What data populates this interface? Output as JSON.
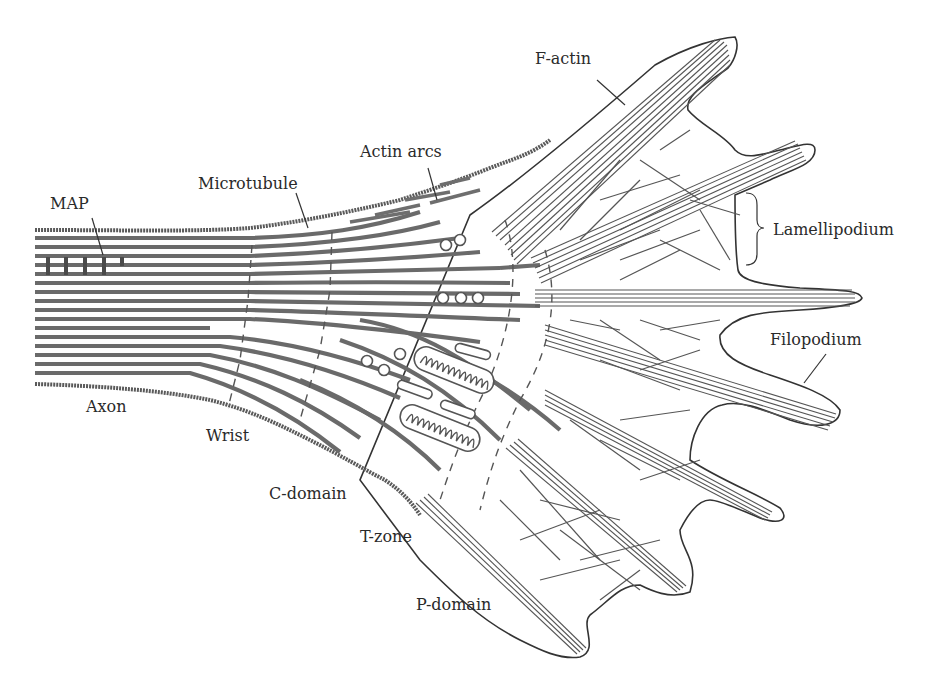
{
  "figure": {
    "colors": {
      "microtubule": "#6a6a6a",
      "actin": "#555555",
      "outline": "#333333",
      "label_text": "#2a2a2a",
      "background": "#ffffff"
    }
  },
  "labels": {
    "f_actin": "F-actin",
    "actin_arcs": "Actin arcs",
    "microtubule": "Microtubule",
    "map": "MAP",
    "lamellipodium": "Lamellipodium",
    "filopodium": "Filopodium",
    "axon": "Axon",
    "wrist": "Wrist",
    "c_domain": "C-domain",
    "t_zone": "T-zone",
    "p_domain": "P-domain"
  }
}
